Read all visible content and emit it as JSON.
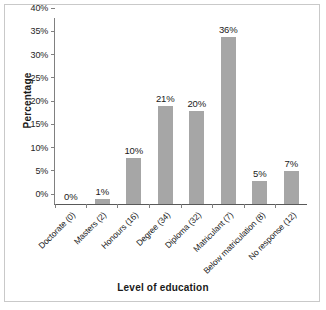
{
  "chart_data": {
    "type": "bar",
    "title": "",
    "xlabel": "Level of education",
    "ylabel": "Percentage",
    "categories": [
      "Doctorate (0)",
      "Masters (2)",
      "Honours (16)",
      "Degree (34)",
      "Diploma (32)",
      "Matriculant (7)",
      "Below matriculation (8)",
      "No response (12)"
    ],
    "values": [
      0,
      1,
      10,
      21,
      20,
      36,
      5,
      7
    ],
    "value_labels": [
      "0%",
      "1%",
      "10%",
      "21%",
      "20%",
      "36%",
      "5%",
      "7%"
    ],
    "ylim": [
      0,
      40
    ],
    "ytick_values": [
      0,
      5,
      10,
      15,
      20,
      25,
      30,
      35,
      40
    ],
    "ytick_labels": [
      "0%",
      "5%",
      "10%",
      "15%",
      "20%",
      "25%",
      "30%",
      "35%",
      "40%"
    ],
    "grid": false,
    "legend": null,
    "bar_color": "#a6a6a6",
    "axis_color": "#808080",
    "text_color": "#1a1a1a",
    "background": "#ffffff",
    "frame_color": "#c9c9c9"
  }
}
